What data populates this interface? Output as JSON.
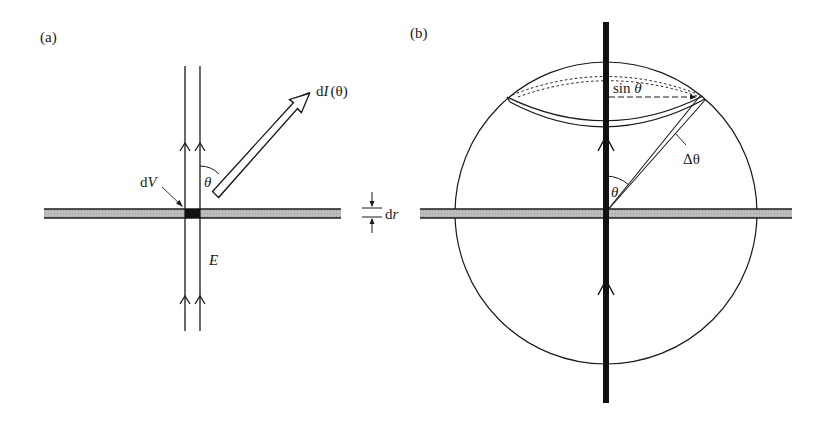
{
  "figure": {
    "panel_a": {
      "label": "(a)",
      "dI_label_prefix": "d",
      "dI_label_var": "I",
      "dI_label_arg": "(θ)",
      "theta_label": "θ",
      "dV_label_prefix": "d",
      "dV_label_var": "V",
      "E_label": "E",
      "dr_label_prefix": "d",
      "dr_label_var": "r"
    },
    "panel_b": {
      "label": "(b)",
      "sin_label_prefix": "sin ",
      "sin_label_var": "θ",
      "delta_theta_label": "Δθ",
      "theta_label": "θ"
    },
    "colors": {
      "line": "#1a1a1a",
      "slab_fill": "#b8b8b8",
      "dV_fill": "#111111",
      "background": "#ffffff"
    }
  }
}
